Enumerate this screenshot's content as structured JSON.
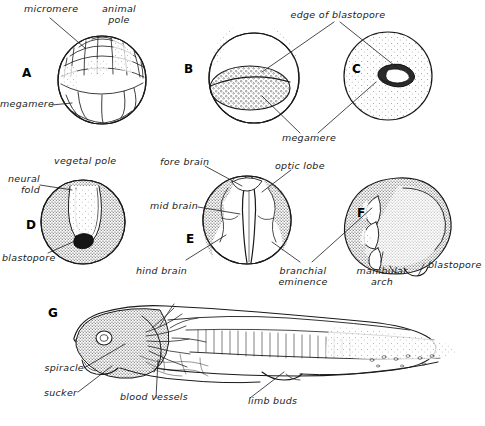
{
  "figure": {
    "background": "#ffffff",
    "ink": "#1a1a1a"
  },
  "panels": [
    {
      "id": "A",
      "letter": "A",
      "caption": "blastula with micromeres and megameres"
    },
    {
      "id": "B",
      "letter": "B",
      "caption": "gastrula showing yolk plug"
    },
    {
      "id": "C",
      "letter": "C",
      "caption": "late gastrula, blastopore slit"
    },
    {
      "id": "D",
      "letter": "D",
      "caption": "neurula, vegetal pole view"
    },
    {
      "id": "E",
      "letter": "E",
      "caption": "neurula, dorsal view of brain regions"
    },
    {
      "id": "F",
      "letter": "F",
      "caption": "tailbud embryo, lateral view"
    },
    {
      "id": "G",
      "letter": "G",
      "caption": "tadpole, lateral view"
    }
  ],
  "labels": {
    "micromere": "micromere",
    "animal_pole": "animal\npole",
    "megamere_a": "megamere",
    "edge_of_blastopore": "edge of blastopore",
    "megamere_bc": "megamere",
    "vegetal_pole": "vegetal pole",
    "neural_fold": "neural\nfold",
    "blastopore_d": "blastopore",
    "fore_brain": "fore brain",
    "optic_lobe": "optic lobe",
    "mid_brain": "mid brain",
    "hind_brain": "hind brain",
    "branchial_eminence": "branchial\neminence",
    "manibular_arch": "manibular\narch",
    "blastopore_f": "blastopore",
    "spiracle": "spiracle",
    "sucker": "sucker",
    "blood_vessels": "blood vessels",
    "limb_buds": "limb buds"
  }
}
